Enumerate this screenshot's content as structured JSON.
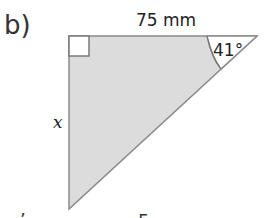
{
  "problem": {
    "part_label": "b)",
    "top_side_label": "75 mm",
    "angle_label": "41°",
    "unknown_side_label": "x",
    "clipped_bottom_text": [
      "’",
      "5"
    ]
  },
  "colors": {
    "fill": "#dcdcdc",
    "stroke": "#8a8a8a",
    "text": "#222222"
  }
}
